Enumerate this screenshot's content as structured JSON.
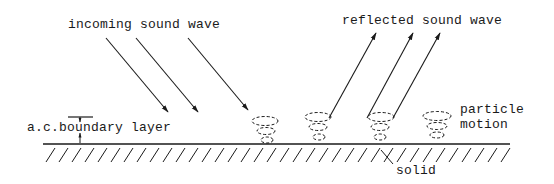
{
  "labels": {
    "incoming": "incoming sound wave",
    "reflected": "reflected sound wave",
    "boundary_layer": "a.c.boundary layer",
    "particle_line1": "particle",
    "particle_line2": "motion",
    "solid": "solid"
  },
  "colors": {
    "ink": "#1a1a1a",
    "background": "#ffffff"
  },
  "geometry": {
    "surface_y": 144,
    "surface_x_start": 43,
    "surface_x_end": 510,
    "incoming_arrows": [
      {
        "x1": 106,
        "y1": 38,
        "x2": 168,
        "y2": 112
      },
      {
        "x1": 136,
        "y1": 38,
        "x2": 198,
        "y2": 112
      },
      {
        "x1": 188,
        "y1": 38,
        "x2": 248,
        "y2": 110
      }
    ],
    "reflected_arrows": [
      {
        "x1": 329,
        "y1": 118,
        "x2": 376,
        "y2": 33
      },
      {
        "x1": 367,
        "y1": 118,
        "x2": 413,
        "y2": 33
      },
      {
        "x1": 393,
        "y1": 118,
        "x2": 440,
        "y2": 33
      }
    ],
    "particle_spirals_x": [
      265,
      318,
      380,
      437
    ]
  }
}
